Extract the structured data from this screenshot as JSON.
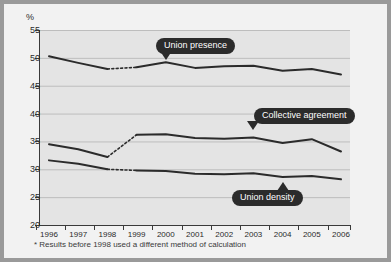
{
  "figure": {
    "unit_label": "%",
    "footnote": "* Results before 1998 used a different method of calculation"
  },
  "callouts": [
    {
      "label": "Union presence",
      "pointer": "down"
    },
    {
      "label": "Collective agreement",
      "pointer": "down"
    },
    {
      "label": "Union density",
      "pointer": "up"
    }
  ],
  "colors": {
    "figure_background": "#f2f2f2",
    "outer_background": "#9a9a9a",
    "plot_background": "#e4e4e4",
    "gridline": "#bdbdbd",
    "axis": "#3a3a3a",
    "series_line": "#2b2b2b",
    "callout_fill": "#2b2b2b",
    "callout_text": "#ffffff"
  },
  "chart_data": {
    "type": "line",
    "title": "",
    "xlabel": "",
    "ylabel": "%",
    "grid": true,
    "legend": "annotations",
    "xlim": [
      1996,
      2006
    ],
    "ylim": [
      20,
      55
    ],
    "ytick_labels": [
      "55",
      "50",
      "45",
      "40",
      "35",
      "30",
      "25",
      "20"
    ],
    "yticks": [
      55,
      50,
      45,
      40,
      35,
      30,
      25,
      20
    ],
    "xtick_labels": [
      "1996",
      "1997",
      "1998",
      "1999",
      "2000",
      "2001",
      "2002",
      "2003",
      "2004",
      "2005",
      "2006"
    ],
    "x": [
      1996,
      1997,
      1998,
      1999,
      2000,
      2001,
      2002,
      2003,
      2004,
      2005,
      2006
    ],
    "break_note": "dotted segment between 1998 and 1999 marks a change of method",
    "series": [
      {
        "name": "Union presence",
        "values": [
          50.3,
          49.1,
          48.0,
          48.3,
          49.2,
          48.2,
          48.5,
          48.6,
          47.7,
          48.0,
          47.0
        ]
      },
      {
        "name": "Collective agreement",
        "values": [
          34.5,
          33.6,
          32.2,
          36.2,
          36.3,
          35.6,
          35.5,
          35.7,
          34.7,
          35.4,
          33.2
        ]
      },
      {
        "name": "Union density",
        "values": [
          31.6,
          31.0,
          30.0,
          29.8,
          29.7,
          29.2,
          29.1,
          29.3,
          28.6,
          28.8,
          28.2
        ]
      }
    ]
  }
}
